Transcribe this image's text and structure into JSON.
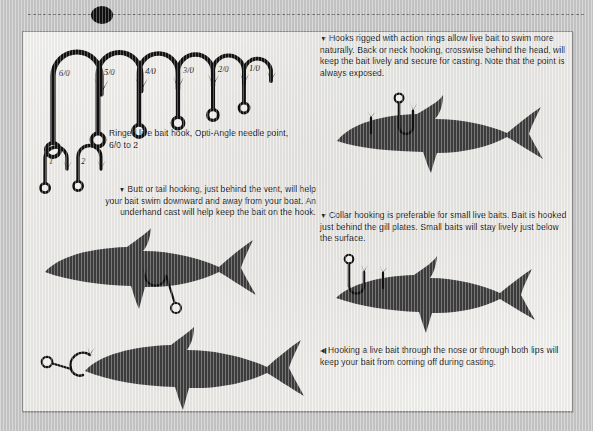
{
  "page": {
    "background_color": "#c9c9c9",
    "paper_color": "#f4f3f0",
    "ink_color": "#1b1b1b",
    "fish_color": "#3d3d3d"
  },
  "hook_chart": {
    "caption": "Ringed live bait hook, Opti-Angle needle point, 6/0 to 2",
    "sizes": [
      "6/0",
      "5/0",
      "4/0",
      "3/0",
      "2/0",
      "1/0"
    ],
    "small_sizes": [
      "1",
      "2"
    ]
  },
  "captions": {
    "back_neck": {
      "marker": "▼",
      "text": "Hooks rigged with action rings allow live bait to swim more naturally. Back or neck hooking, crosswise behind the head, will keep the bait lively and secure for casting. Note that the point is always exposed."
    },
    "butt_tail": {
      "marker": "▼",
      "text": "Butt or tail hooking, just behind the vent, will help your bait swim downward and away from your boat. An underhand cast will help keep the bait on the hook."
    },
    "collar": {
      "marker": "▼",
      "text": "Collar hooking is preferable for small live baits. Bait is hooked just behind the gill plates. Small baits will stay lively just below the surface."
    },
    "nose": {
      "marker": "◀",
      "text": "Hooking a live bait through the nose or through both lips will keep your bait from coming off during casting."
    }
  }
}
